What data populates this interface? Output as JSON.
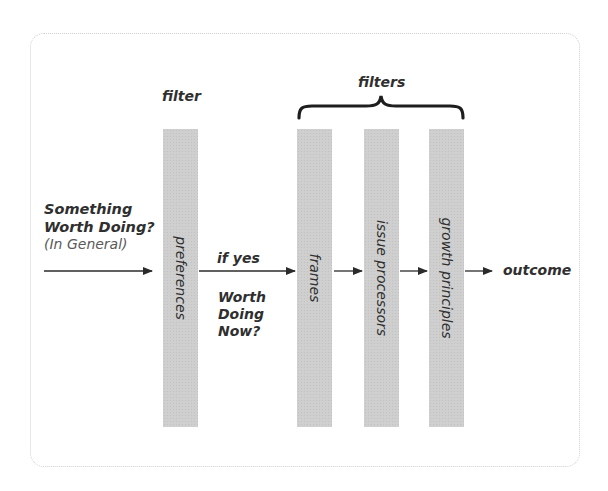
{
  "diagram": {
    "input": {
      "line1": "Something",
      "line2": "Worth Doing?",
      "line3": "(In General)"
    },
    "first_filter": {
      "heading": "filter",
      "bar_label": "preferences"
    },
    "condition": {
      "label": "if yes",
      "line1": "Worth",
      "line2": "Doing",
      "line3": "Now?"
    },
    "filters_group": {
      "heading": "filters",
      "bars": [
        {
          "label": "frames"
        },
        {
          "label": "issue processors"
        },
        {
          "label": "growth principles"
        }
      ]
    },
    "output": {
      "label": "outcome"
    },
    "colors": {
      "bar": "#cfcfcf",
      "arrow": "#2b2b2b",
      "border": "#cfcfcf"
    }
  }
}
